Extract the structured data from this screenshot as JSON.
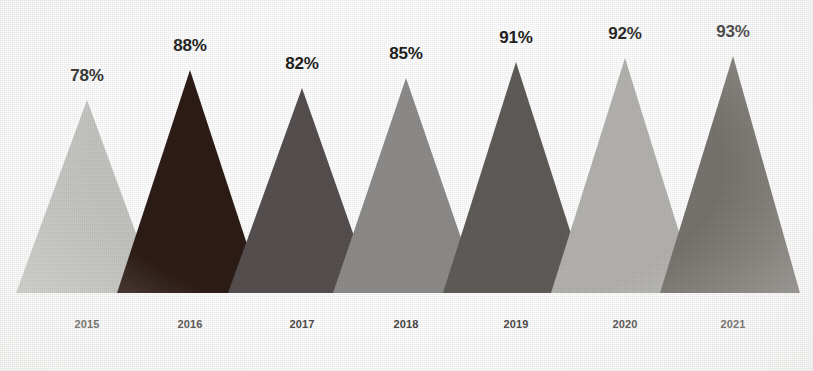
{
  "chart_data": {
    "type": "bar",
    "shape": "triangle",
    "title": "",
    "subtitle": "",
    "xlabel": "",
    "ylabel": "",
    "categories": [
      "2015",
      "2016",
      "2017",
      "2018",
      "2019",
      "2020",
      "2021"
    ],
    "values": [
      78,
      88,
      82,
      85,
      91,
      92,
      93
    ],
    "value_labels": [
      "78%",
      "88%",
      "82%",
      "85%",
      "91%",
      "92%",
      "93%"
    ],
    "unit": "%",
    "ylim": [
      0,
      100
    ],
    "grid": false,
    "legend": false,
    "legend_position": "none",
    "background_color": "#ffffff",
    "series": [
      {
        "name": "",
        "values": [
          78,
          88,
          82,
          85,
          91,
          92,
          93
        ],
        "colors": [
          "#c5c5c2",
          "#2e1d16",
          "#565150",
          "#8e8d8b",
          "#605d59",
          "#b5b4b1",
          "#78746f"
        ]
      }
    ],
    "points": [
      {
        "category": "2015",
        "value": 78,
        "label": "78%",
        "color": "#c5c5c2",
        "apex_x": 87,
        "apex_y": 100,
        "base_left": 16,
        "base_right": 158
      },
      {
        "category": "2016",
        "value": 88,
        "label": "88%",
        "color": "#2e1d16",
        "apex_x": 190,
        "apex_y": 70,
        "base_left": 117,
        "base_right": 263
      },
      {
        "category": "2017",
        "value": 82,
        "label": "82%",
        "color": "#565150",
        "apex_x": 302,
        "apex_y": 88,
        "base_left": 228,
        "base_right": 374
      },
      {
        "category": "2018",
        "value": 85,
        "label": "85%",
        "color": "#8e8d8b",
        "apex_x": 406,
        "apex_y": 78,
        "base_left": 333,
        "base_right": 480
      },
      {
        "category": "2019",
        "value": 91,
        "label": "91%",
        "color": "#605d59",
        "apex_x": 516,
        "apex_y": 62,
        "base_left": 443,
        "base_right": 590
      },
      {
        "category": "2020",
        "value": 92,
        "label": "92%",
        "color": "#b5b4b1",
        "apex_x": 625,
        "apex_y": 58,
        "base_left": 551,
        "base_right": 698
      },
      {
        "category": "2021",
        "value": 93,
        "label": "93%",
        "color": "#78746f",
        "apex_x": 733,
        "apex_y": 56,
        "base_left": 660,
        "base_right": 800
      }
    ],
    "baseline_y": 293,
    "value_label_y": 38,
    "year_label_y": 318
  }
}
